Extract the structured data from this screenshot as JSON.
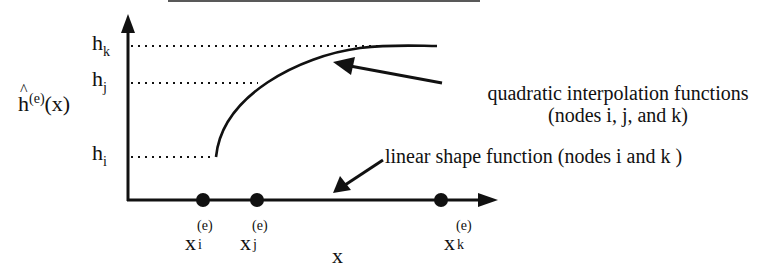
{
  "figure": {
    "title_cropped": "",
    "y_axis_label": {
      "base": "h",
      "superscript": "(e)",
      "arg": "(x)",
      "accent": "hat"
    },
    "x_axis_label": "x",
    "y_levels": [
      {
        "id": "hk",
        "base": "h",
        "sub": "k"
      },
      {
        "id": "hj",
        "base": "h",
        "sub": "j"
      },
      {
        "id": "hi",
        "base": "h",
        "sub": "i"
      }
    ],
    "nodes": [
      {
        "id": "xi",
        "base": "x",
        "sub": "i",
        "sup": "(e)"
      },
      {
        "id": "xj",
        "base": "x",
        "sub": "j",
        "sup": "(e)"
      },
      {
        "id": "xk",
        "base": "x",
        "sub": "k",
        "sup": "(e)"
      }
    ],
    "annotations": {
      "quadratic_line1": "quadratic interpolation functions",
      "quadratic_line2": "(nodes i, j, and k)",
      "linear": "linear shape function (nodes i and k )"
    },
    "colors": {
      "ink": "#111111",
      "background": "#ffffff"
    }
  }
}
